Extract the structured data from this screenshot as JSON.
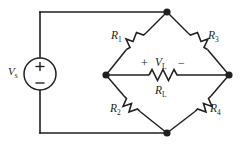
{
  "figure": {
    "type": "schematic-diagram",
    "background_color": "#ffffff",
    "line_color": "#231f20"
  },
  "source": {
    "name": "voltage-source",
    "label_v": "V",
    "label_sub": "s",
    "plus_sign": "+",
    "minus_sign": "−"
  },
  "bridge": {
    "arms": [
      {
        "id": "R1",
        "label_r": "R",
        "label_sub": "1",
        "position": "upper-left"
      },
      {
        "id": "R3",
        "label_r": "R",
        "label_sub": "3",
        "position": "upper-right"
      },
      {
        "id": "R2",
        "label_r": "R",
        "label_sub": "2",
        "position": "lower-left"
      },
      {
        "id": "R4",
        "label_r": "R",
        "label_sub": "4",
        "position": "lower-right"
      }
    ],
    "load": {
      "id": "RL",
      "label_r": "R",
      "label_sub": "L",
      "voltage_v": "V",
      "voltage_sub": "L",
      "plus_sign": "+",
      "minus_sign": "−"
    }
  }
}
